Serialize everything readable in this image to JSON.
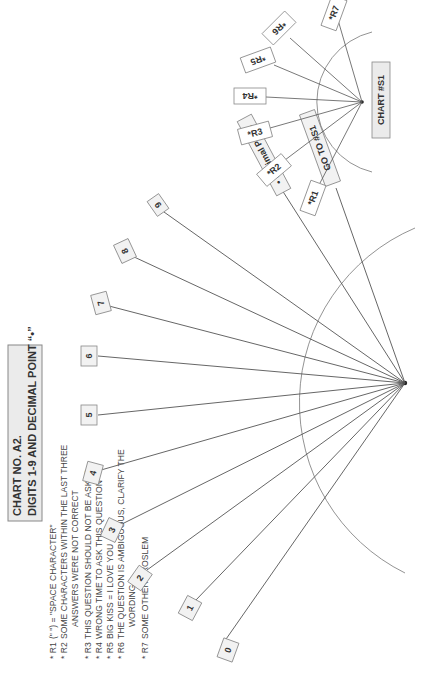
{
  "legend": {
    "title_line1": "CHART NO. A2.",
    "title_line2": "DIGITS 1-9 AND DECIMAL POINT “•”",
    "items": [
      {
        "code": "* R1",
        "text": "(\" \") = \"SPACE CHARACTER\""
      },
      {
        "code": "* R2",
        "text": "SOME CHARACTERS WITHIN THE LAST THREE"
      },
      {
        "code": "",
        "text": "ANSWERS WERE NOT CORRECT"
      },
      {
        "code": "* R3",
        "text": "THIS QUESTION SHOULD NOT BE ASKED"
      },
      {
        "code": "* R4",
        "text": "WRONG TIME TO ASK THIS QUESTION"
      },
      {
        "code": "* R5",
        "text": "BIG KISS = I LOVE YOU"
      },
      {
        "code": "* R6",
        "text": "THE QUESTION IS AMBIGUOUS, CLARIFY THE"
      },
      {
        "code": "",
        "text": "WORDING"
      },
      {
        "code": "* R7",
        "text": "SOME OTHER PROSLEM"
      }
    ]
  },
  "main_chart": {
    "labels": [
      "0",
      "1",
      "2",
      "3",
      "4",
      "5",
      "6",
      "7",
      "8",
      "9",
      "• Decimal Point",
      "GO TO #S1"
    ]
  },
  "sub_chart": {
    "title": "CHART #S1",
    "labels": [
      "*R1",
      "*R2",
      "*R3",
      "*R4",
      "*R5",
      "*R6",
      "*R7"
    ]
  },
  "colors": {
    "line": "#555555",
    "box_fill": "#f2f2f2",
    "box_stroke": "#888888",
    "ink": "#333333"
  }
}
